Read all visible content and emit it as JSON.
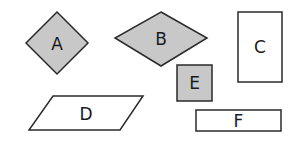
{
  "diagram": {
    "background": "#ffffff",
    "stroke_color": "#2a2a2a",
    "shaded_fill": "#c8c8c8",
    "unshaded_fill": "#ffffff",
    "shapes": [
      {
        "id": "A",
        "label": "A",
        "kind": "square-rotated (diamond)",
        "shaded": true
      },
      {
        "id": "B",
        "label": "B",
        "kind": "rhombus",
        "shaded": true
      },
      {
        "id": "C",
        "label": "C",
        "kind": "rectangle (tall)",
        "shaded": false
      },
      {
        "id": "D",
        "label": "D",
        "kind": "parallelogram",
        "shaded": false
      },
      {
        "id": "E",
        "label": "E",
        "kind": "square",
        "shaded": true
      },
      {
        "id": "F",
        "label": "F",
        "kind": "rectangle (wide)",
        "shaded": false
      }
    ]
  }
}
